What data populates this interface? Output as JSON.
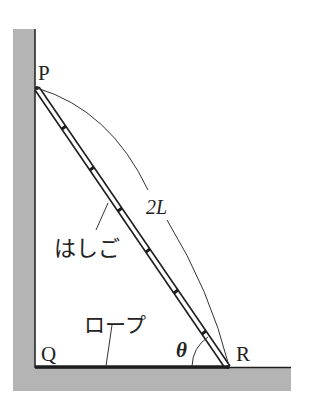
{
  "diagram": {
    "labels": {
      "P": "P",
      "Q": "Q",
      "R": "R",
      "length": "2L",
      "ladder": "はしご",
      "rope": "ロープ",
      "angle": "θ"
    },
    "colors": {
      "wall_fill": "#b4b4b4",
      "line": "#1e1e1e",
      "text": "#222222"
    },
    "points": {
      "P": [
        36,
        88
      ],
      "Q": [
        35,
        367
      ],
      "R": [
        229,
        367
      ]
    }
  }
}
